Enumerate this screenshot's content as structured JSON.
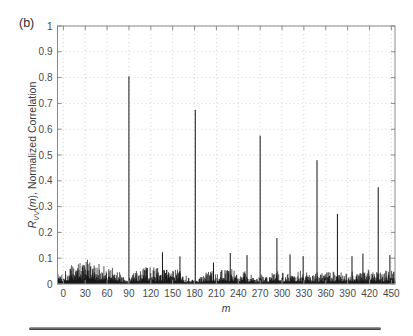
{
  "figure": {
    "panel_label": "(b)"
  },
  "chart_data": {
    "type": "line",
    "title": "",
    "xlabel": "m",
    "ylabel": "R_VV(m), Normalized Correlation",
    "ylabel_parts": {
      "r": "R",
      "sub": "VV",
      "open": "(",
      "m": "m",
      "rest": "), Normalized Correlation"
    },
    "xlim": [
      -8,
      455
    ],
    "ylim": [
      0,
      1
    ],
    "xticks": [
      0,
      30,
      60,
      90,
      120,
      150,
      180,
      210,
      240,
      270,
      300,
      330,
      360,
      390,
      420,
      450
    ],
    "yticks": [
      0,
      0.1,
      0.2,
      0.3,
      0.4,
      0.5,
      0.6,
      0.7,
      0.8,
      0.9,
      1
    ],
    "ytick_labels": [
      "0",
      "0.1",
      "0.2",
      "0.3",
      "0.4",
      "0.5",
      "0.6",
      "0.7",
      "0.8",
      "0.9",
      "1"
    ],
    "grid": "dotted",
    "legend": "none",
    "series_color": "#111111",
    "axis_color": "#8a8a8a",
    "grid_color": "#c9c9c9",
    "text_color": "#4a4a4a",
    "peaks": [
      [
        90,
        0.805
      ],
      [
        136,
        0.123
      ],
      [
        160,
        0.107
      ],
      [
        181,
        0.675
      ],
      [
        206,
        0.083
      ],
      [
        229,
        0.12
      ],
      [
        252,
        0.112
      ],
      [
        270,
        0.575
      ],
      [
        293,
        0.178
      ],
      [
        311,
        0.115
      ],
      [
        329,
        0.108
      ],
      [
        348,
        0.48
      ],
      [
        376,
        0.272
      ],
      [
        396,
        0.108
      ],
      [
        411,
        0.118
      ],
      [
        432,
        0.375
      ],
      [
        448,
        0.112
      ]
    ],
    "noise_envelope": [
      [
        -8,
        0.045
      ],
      [
        0,
        0.05
      ],
      [
        12,
        0.065
      ],
      [
        22,
        0.08
      ],
      [
        32,
        0.082
      ],
      [
        45,
        0.062
      ],
      [
        55,
        0.075
      ],
      [
        68,
        0.055
      ],
      [
        80,
        0.03
      ],
      [
        88,
        0.012
      ],
      [
        96,
        0.035
      ],
      [
        108,
        0.055
      ],
      [
        120,
        0.06
      ],
      [
        134,
        0.05
      ],
      [
        148,
        0.055
      ],
      [
        163,
        0.04
      ],
      [
        176,
        0.014
      ],
      [
        186,
        0.02
      ],
      [
        200,
        0.045
      ],
      [
        214,
        0.055
      ],
      [
        230,
        0.05
      ],
      [
        246,
        0.045
      ],
      [
        258,
        0.03
      ],
      [
        266,
        0.018
      ],
      [
        276,
        0.028
      ],
      [
        290,
        0.045
      ],
      [
        305,
        0.04
      ],
      [
        320,
        0.045
      ],
      [
        335,
        0.04
      ],
      [
        350,
        0.034
      ],
      [
        365,
        0.04
      ],
      [
        380,
        0.04
      ],
      [
        395,
        0.042
      ],
      [
        410,
        0.046
      ],
      [
        425,
        0.04
      ],
      [
        440,
        0.046
      ],
      [
        455,
        0.05
      ]
    ],
    "noise_seed": 1337
  }
}
